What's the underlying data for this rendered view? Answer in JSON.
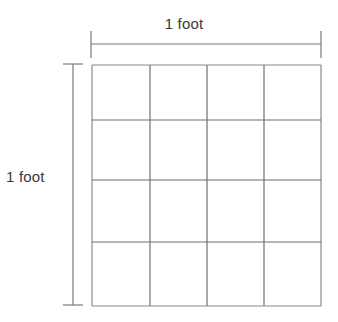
{
  "figure": {
    "background_color": "#ffffff",
    "line_color": "#7a7a7a",
    "grid_outline_color": "#8a8a8a",
    "text_color": "#3a3a3a"
  },
  "labels": {
    "top": "1 foot",
    "left": "1 foot"
  },
  "grid": {
    "rows": 4,
    "columns": 4,
    "cells_total": 16,
    "left": 92,
    "top": 65,
    "right": 321,
    "bottom": 306,
    "column_lines_x": [
      92,
      150,
      207,
      264,
      321
    ],
    "row_lines_y": [
      65,
      120,
      180,
      242,
      306
    ]
  },
  "dimensions": {
    "horizontal": {
      "label": "1 foot",
      "line_y": 44,
      "x_start": 91,
      "x_end": 321,
      "tick_top": 31,
      "tick_bottom": 58
    },
    "vertical": {
      "label": "1 foot",
      "line_x": 73,
      "y_start": 64,
      "y_end": 305,
      "tick_left": 63,
      "tick_right": 83
    }
  }
}
